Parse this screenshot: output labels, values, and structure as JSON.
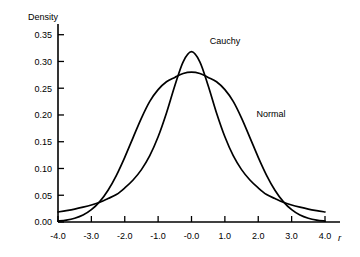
{
  "chart_data": {
    "type": "line",
    "title": "",
    "xlabel": "r",
    "ylabel": "Density",
    "xlim": [
      -4.0,
      4.0
    ],
    "ylim": [
      0.0,
      0.37
    ],
    "grid": false,
    "legend_position": "inline-annotation",
    "xticks": [
      "-4.0",
      "-3.0",
      "-2.0",
      "-1.0",
      "-0.0",
      "1.0",
      "2.0",
      "3.0",
      "4.0"
    ],
    "xtick_values": [
      -4.0,
      -3.0,
      -2.0,
      -1.0,
      0.0,
      1.0,
      2.0,
      3.0,
      4.0
    ],
    "yticks": [
      "0.00",
      "0.05",
      "0.10",
      "0.15",
      "0.20",
      "0.25",
      "0.30",
      "0.35"
    ],
    "ytick_values": [
      0.0,
      0.05,
      0.1,
      0.15,
      0.2,
      0.25,
      0.3,
      0.35
    ],
    "annotations": [
      {
        "text": "Cauchy",
        "x": 0.55,
        "y": 0.333
      },
      {
        "text": "Normal",
        "x": 1.95,
        "y": 0.197
      }
    ],
    "series": [
      {
        "name": "Cauchy",
        "color": "#000000",
        "peak": 0.3183,
        "x": [
          -4.0,
          -3.75,
          -3.5,
          -3.25,
          -3.0,
          -2.75,
          -2.5,
          -2.25,
          -2.0,
          -1.75,
          -1.5,
          -1.25,
          -1.0,
          -0.75,
          -0.5,
          -0.25,
          0.0,
          0.25,
          0.5,
          0.75,
          1.0,
          1.25,
          1.5,
          1.75,
          2.0,
          2.25,
          2.5,
          2.75,
          3.0,
          3.25,
          3.5,
          3.75,
          4.0
        ],
        "values": [
          0.0187,
          0.0212,
          0.0241,
          0.0277,
          0.0318,
          0.0369,
          0.0439,
          0.0513,
          0.0637,
          0.0785,
          0.0979,
          0.1239,
          0.1592,
          0.2037,
          0.2546,
          0.2994,
          0.3183,
          0.2994,
          0.2546,
          0.2037,
          0.1592,
          0.1239,
          0.0979,
          0.0785,
          0.0637,
          0.0513,
          0.0439,
          0.0369,
          0.0318,
          0.0277,
          0.0241,
          0.0212,
          0.0187
        ]
      },
      {
        "name": "Normal",
        "color": "#000000",
        "peak": 0.28,
        "x": [
          -4.0,
          -3.75,
          -3.5,
          -3.25,
          -3.0,
          -2.75,
          -2.5,
          -2.25,
          -2.0,
          -1.75,
          -1.5,
          -1.25,
          -1.0,
          -0.75,
          -0.5,
          -0.25,
          0.0,
          0.25,
          0.5,
          0.75,
          1.0,
          1.25,
          1.5,
          1.75,
          2.0,
          2.25,
          2.5,
          2.75,
          3.0,
          3.25,
          3.5,
          3.75,
          4.0
        ],
        "values": [
          0.0016,
          0.0035,
          0.007,
          0.013,
          0.023,
          0.0381,
          0.0594,
          0.0873,
          0.1209,
          0.1578,
          0.1942,
          0.2254,
          0.2473,
          0.262,
          0.2702,
          0.2775,
          0.28,
          0.2775,
          0.2702,
          0.262,
          0.2473,
          0.2254,
          0.1942,
          0.1578,
          0.1209,
          0.0873,
          0.0594,
          0.0381,
          0.023,
          0.013,
          0.007,
          0.0035,
          0.0016
        ]
      }
    ]
  }
}
